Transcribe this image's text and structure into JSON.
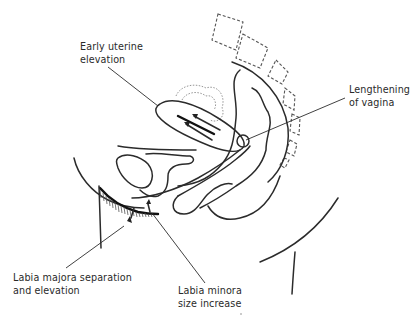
{
  "diagram": {
    "labels": {
      "uterine": [
        "Early uterine",
        "elevation"
      ],
      "vagina": [
        "Lengthening",
        "of vagina"
      ],
      "majora": [
        "Labia majora separation",
        "and elevation"
      ],
      "minora": [
        "Labia minora",
        "size increase"
      ]
    },
    "colors": {
      "line": "#2b2b2b",
      "background": "#ffffff",
      "dashed_vertebrae": "#555555",
      "dotted_outline": "#8a8a8a"
    }
  }
}
